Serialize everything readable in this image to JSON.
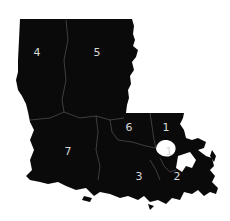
{
  "map": {
    "region": "Louisiana",
    "colors": {
      "land": "#0a0a0a",
      "border": "#555555",
      "label": "#d8d8d8",
      "water": "#ffffff"
    },
    "districts": [
      {
        "id": "4",
        "label": "4"
      },
      {
        "id": "5",
        "label": "5"
      },
      {
        "id": "6",
        "label": "6"
      },
      {
        "id": "1-north",
        "label": "1"
      },
      {
        "id": "1-south",
        "label": "1"
      },
      {
        "id": "7",
        "label": "7"
      },
      {
        "id": "3",
        "label": "3"
      },
      {
        "id": "2",
        "label": "2"
      }
    ]
  }
}
